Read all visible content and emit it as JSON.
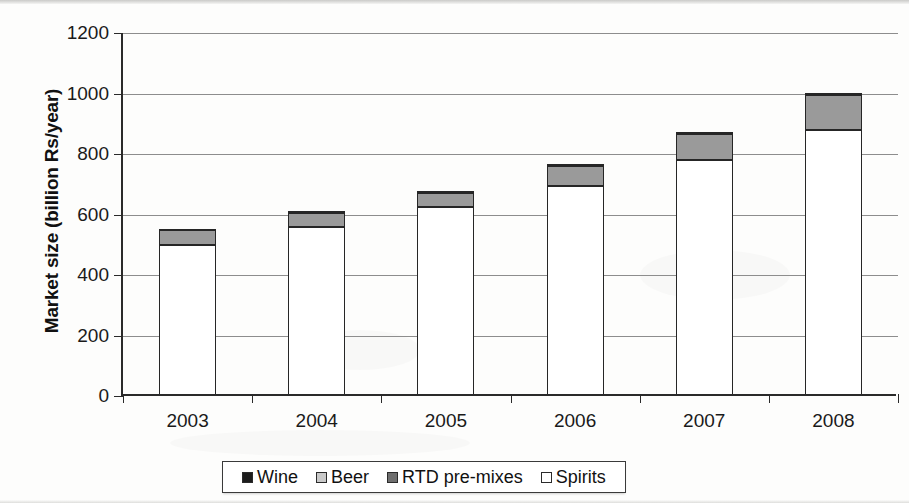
{
  "chart_data": {
    "type": "bar",
    "stacked": true,
    "title": "",
    "xlabel": "",
    "ylabel": "Market size (billion Rs/year)",
    "categories": [
      "2003",
      "2004",
      "2005",
      "2006",
      "2007",
      "2008"
    ],
    "ylim": [
      0,
      1200
    ],
    "yticks": [
      0,
      200,
      400,
      600,
      800,
      1000,
      1200
    ],
    "ytick_labels": [
      "0",
      "200",
      "400",
      "600",
      "800",
      "1000",
      "1200"
    ],
    "grid": true,
    "grid_axis": "y",
    "legend_position": "bottom",
    "series": [
      {
        "name": "Spirits",
        "color": "#ffffff",
        "values": [
          490,
          550,
          615,
          685,
          770,
          870
        ]
      },
      {
        "name": "RTD pre-mixes",
        "color": "#6e6e6e",
        "values": [
          0,
          0,
          0,
          0,
          0,
          0
        ]
      },
      {
        "name": "Beer",
        "color": "#9a9a9a",
        "values": [
          50,
          45,
          45,
          65,
          85,
          115
        ]
      },
      {
        "name": "Wine",
        "color": "#1c1c1c",
        "values": [
          0,
          5,
          5,
          5,
          5,
          5
        ]
      }
    ],
    "totals": [
      540,
      600,
      665,
      755,
      860,
      990
    ],
    "stack_order_bottom_to_top": [
      "Spirits",
      "RTD pre-mixes",
      "Beer",
      "Wine"
    ]
  },
  "legend": {
    "items": [
      {
        "label": "Wine",
        "swatch_color": "#1c1c1c"
      },
      {
        "label": "Beer",
        "swatch_color": "#c9c9c9"
      },
      {
        "label": "RTD pre-mixes",
        "swatch_color": "#6e6e6e"
      },
      {
        "label": "Spirits",
        "swatch_color": "#ffffff"
      }
    ]
  },
  "colors": {
    "axis": "#2a2a2a",
    "grid": "#8d8d8d",
    "bar_outline": "#262626",
    "background": "#fdfdfc"
  }
}
